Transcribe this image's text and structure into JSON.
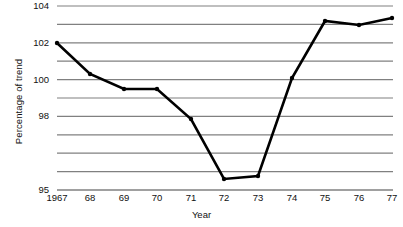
{
  "chart_data": {
    "type": "line",
    "title": "",
    "xlabel": "Year",
    "ylabel": "Percentage of trend",
    "x": [
      1967,
      1968,
      1969,
      1970,
      1971,
      1972,
      1973,
      1974,
      1975,
      1976,
      1977
    ],
    "categories": [
      "1967",
      "68",
      "69",
      "70",
      "71",
      "72",
      "73",
      "74",
      "75",
      "76",
      "77"
    ],
    "values": [
      102.0,
      100.3,
      99.5,
      99.5,
      97.9,
      95.3,
      95.4,
      100.1,
      103.25,
      103.0,
      103.4
    ],
    "series": [
      {
        "name": "Percentage of trend",
        "values": [
          102.0,
          100.3,
          99.5,
          99.5,
          97.9,
          95.3,
          95.4,
          100.1,
          103.25,
          103.0,
          103.4
        ]
      }
    ],
    "ylim": [
      95,
      104
    ],
    "xlim": [
      1967,
      1977
    ],
    "y_tick_labels": [
      "104",
      "102",
      "100",
      "98",
      "95"
    ],
    "y_tick_values": [
      104,
      102,
      100,
      98,
      95
    ],
    "y_tick_pixel_y": [
      6,
      42.8,
      79.6,
      116.4,
      190
    ],
    "gridline_pixel_y": [
      6,
      24.4,
      42.8,
      61.2,
      79.6,
      98,
      116.4,
      134.8,
      153.2,
      171.6,
      190
    ],
    "grid": true,
    "grid_axis": "y",
    "legend": "none",
    "marker": "circle",
    "line_color": "#000000",
    "grid_color": "#808080",
    "background_color": "#ffffff",
    "plot_left_px": 57,
    "plot_right_px": 393,
    "point_pixels": [
      {
        "label": "1967",
        "value": 102.0,
        "x": 57,
        "y": 43
      },
      {
        "label": "68",
        "value": 100.3,
        "x": 90,
        "y": 74
      },
      {
        "label": "69",
        "value": 99.5,
        "x": 124,
        "y": 89
      },
      {
        "label": "70",
        "value": 99.5,
        "x": 157,
        "y": 89
      },
      {
        "label": "71",
        "value": 97.9,
        "x": 191,
        "y": 119
      },
      {
        "label": "72",
        "value": 95.3,
        "x": 224,
        "y": 179
      },
      {
        "label": "73",
        "value": 95.4,
        "x": 258,
        "y": 176
      },
      {
        "label": "74",
        "value": 100.1,
        "x": 292,
        "y": 78
      },
      {
        "label": "75",
        "value": 103.25,
        "x": 325,
        "y": 21
      },
      {
        "label": "76",
        "value": 103.0,
        "x": 359,
        "y": 25
      },
      {
        "label": "77",
        "value": 103.4,
        "x": 392,
        "y": 18
      }
    ]
  }
}
